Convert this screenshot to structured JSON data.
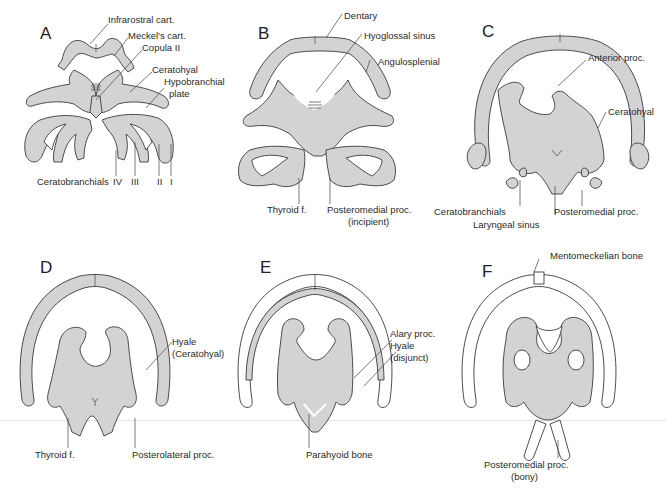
{
  "figure": {
    "colors": {
      "cartilage": "#d3d3d3",
      "outline": "#3a3a3a",
      "bone": "#ffffff",
      "background": "#ffffff"
    }
  },
  "panels": [
    {
      "letter": "A",
      "labels": [
        "Infrarostral cart.",
        "Meckel's cart.",
        "Copula II",
        "Ceratohyal",
        "Hypobranchial",
        "plate",
        "Ceratobranchials",
        "IV",
        "III",
        "II",
        "I"
      ]
    },
    {
      "letter": "B",
      "labels": [
        "Dentary",
        "Hyoglossal sinus",
        "Angulosplenial",
        "Thyroid f.",
        "Posteromedial proc.",
        "(incipient)"
      ]
    },
    {
      "letter": "C",
      "labels": [
        "Anterior proc.",
        "Ceratohyal",
        "Ceratobranchials",
        "Laryngeal sinus",
        "Posteromedial proc."
      ]
    },
    {
      "letter": "D",
      "labels": [
        "Hyale",
        "(Ceratohyal)",
        "Thyroid f.",
        "Posterolateral proc."
      ]
    },
    {
      "letter": "E",
      "labels": [
        "Alary proc.",
        "Hyale",
        "(disjunct)",
        "Parahyoid bone"
      ]
    },
    {
      "letter": "F",
      "labels": [
        "Mentomeckelian bone",
        "Posteromedial proc.",
        "(bony)"
      ]
    }
  ]
}
